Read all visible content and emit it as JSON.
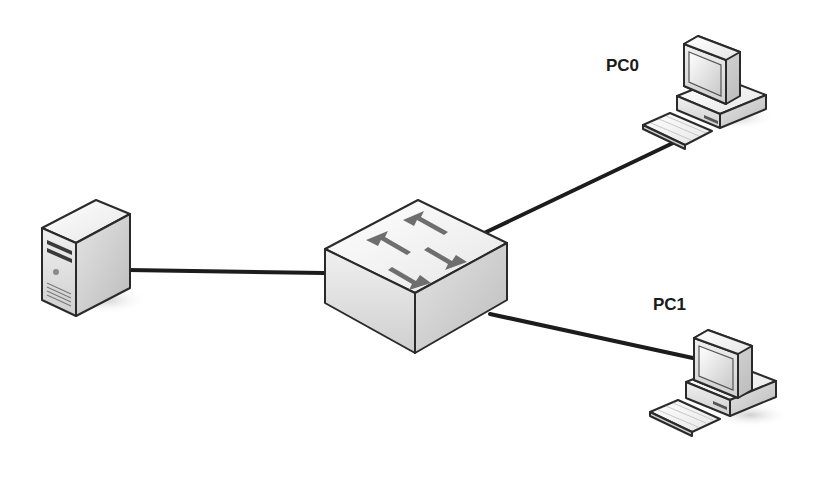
{
  "diagram": {
    "type": "network-topology",
    "nodes": [
      {
        "id": "server",
        "kind": "server",
        "label": ""
      },
      {
        "id": "switch",
        "kind": "switch",
        "label": ""
      },
      {
        "id": "pc0",
        "kind": "pc",
        "label": "PC0"
      },
      {
        "id": "pc1",
        "kind": "pc",
        "label": "PC1"
      }
    ],
    "links": [
      {
        "from": "server",
        "to": "switch"
      },
      {
        "from": "switch",
        "to": "pc0"
      },
      {
        "from": "switch",
        "to": "pc1"
      }
    ]
  },
  "colors": {
    "background": "#ffffff",
    "link": "#1c1c1c",
    "device_light": "#f2f2f2",
    "device_mid": "#d9d9d9",
    "device_dark": "#bdbdbd",
    "arrow": "#6e6e6e",
    "outline": "#2a2a2a",
    "shadow": "#d6d6d6"
  }
}
